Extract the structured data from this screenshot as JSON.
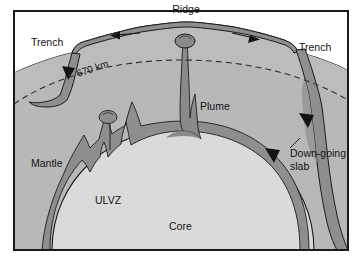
{
  "figure": {
    "type": "cross-section-diagram",
    "frame": {
      "border_color": "#1a1a1a",
      "background_color": "#ffffff"
    }
  },
  "palette": {
    "mantle_fill": "#b4b4b4",
    "mantle_fill_upper": "#bdbdbd",
    "core_fill": "#d8d8d8",
    "slab_fill": "#8e8e8e",
    "plume_fill": "#8a8a8a",
    "ulvz_fill": "#8a8a8a",
    "outline": "#1c1c1c",
    "dashed_line": "#2a2a2a",
    "text_color": "#131313"
  },
  "labels": {
    "ridge": "Ridge",
    "trench_left": "Trench",
    "trench_right": "Trench",
    "discontinuity": "670 km",
    "plume": "Plume",
    "mantle": "Mantle",
    "ulvz": "ULVZ",
    "core": "Core",
    "down_going_slab_line1": "Down-going",
    "down_going_slab_line2": "slab"
  },
  "features": [
    {
      "name": "ridge",
      "label": "Ridge",
      "description": "Mid-ocean spreading center at top center with plume head beneath"
    },
    {
      "name": "trench-left",
      "label": "Trench",
      "description": "Left subduction trench where plate descends and stalls at 670 km"
    },
    {
      "name": "trench-right",
      "label": "Trench",
      "description": "Right subduction trench where slab penetrates to core-mantle boundary"
    },
    {
      "name": "discontinuity-670",
      "label": "670 km",
      "description": "Dashed line marking the 670 km mantle discontinuity"
    },
    {
      "name": "plume",
      "label": "Plume",
      "description": "Narrow mantle plume rising from core-mantle boundary to the ridge"
    },
    {
      "name": "mantle",
      "label": "Mantle",
      "description": "Bulk silicate mantle region"
    },
    {
      "name": "ulvz",
      "label": "ULVZ",
      "description": "Ultra low velocity zone as a thin dark layer on the core-mantle boundary"
    },
    {
      "name": "core",
      "label": "Core",
      "description": "Earth's core, light filled circle at the base"
    },
    {
      "name": "down-going-slab",
      "label": "Down-going slab",
      "description": "Subducted slab sinking through the lower mantle on the right"
    }
  ],
  "arrows": [
    {
      "name": "spreading-arrow-left",
      "direction": "left",
      "description": "Plate motion away from ridge toward left trench"
    },
    {
      "name": "spreading-arrow-right",
      "direction": "right",
      "description": "Plate motion away from ridge toward right trench"
    },
    {
      "name": "subduction-arrow-left",
      "direction": "down",
      "description": "Downward motion at left trench"
    },
    {
      "name": "slab-arrow-upper-right",
      "direction": "down",
      "description": "Slab descent arrow upper"
    },
    {
      "name": "slab-arrow-lower-right",
      "direction": "down",
      "description": "Slab descent arrow lower"
    }
  ]
}
